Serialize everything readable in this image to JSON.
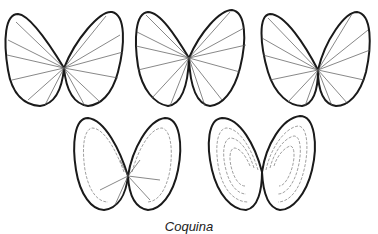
{
  "figure": {
    "caption": "Coquina",
    "shells": [
      {
        "id": "shell-1",
        "row": 1,
        "pattern": "radial-ribs"
      },
      {
        "id": "shell-2",
        "row": 1,
        "pattern": "radial-ribs"
      },
      {
        "id": "shell-3",
        "row": 1,
        "pattern": "radial-ribs"
      },
      {
        "id": "shell-4",
        "row": 2,
        "pattern": "radial-and-concentric"
      },
      {
        "id": "shell-5",
        "row": 2,
        "pattern": "concentric-rings"
      }
    ],
    "colors": {
      "background": "#ffffff",
      "ink": "#1a1a1a"
    }
  }
}
